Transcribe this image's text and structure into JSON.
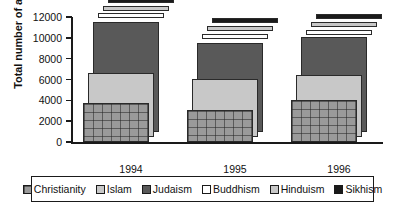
{
  "chart_data": {
    "type": "bar",
    "title": "",
    "xlabel": "Year",
    "ylabel": "Total number of articles",
    "categories": [
      "1994",
      "1995",
      "1996"
    ],
    "ylim": [
      0,
      12000
    ],
    "ytick_labels": [
      "0",
      "2000",
      "4000",
      "6000",
      "8000",
      "10000",
      "12000"
    ],
    "ytick_values": [
      0,
      2000,
      4000,
      6000,
      8000,
      10000,
      12000
    ],
    "grid": false,
    "legend_position": "bottom",
    "series": [
      {
        "name": "Christianity",
        "color": "#9a9a9a",
        "pattern": "checkered",
        "values": [
          3750,
          3100,
          4000
        ]
      },
      {
        "name": "Islam",
        "color": "#c8c8c8",
        "pattern": "solid-light",
        "values": [
          6150,
          5550,
          6000
        ]
      },
      {
        "name": "Judaism",
        "color": "#595959",
        "pattern": "solid-dark",
        "values": [
          10600,
          8550,
          9100
        ]
      },
      {
        "name": "Buddhism",
        "color": "#ffffff",
        "pattern": "solid-white",
        "values": [
          10900,
          8900,
          9350
        ]
      },
      {
        "name": "Hinduism",
        "color": "#c8c8c8",
        "pattern": "solid-light",
        "values": [
          11150,
          9200,
          9600
        ]
      },
      {
        "name": "Sikhism",
        "color": "#1a1a1a",
        "pattern": "solid-black",
        "values": [
          11400,
          9500,
          9850
        ]
      }
    ]
  },
  "axes": {
    "y_title": "Total number of articles",
    "x_title": "Year",
    "y_ticks": [
      {
        "label": "12000",
        "value": 12000
      },
      {
        "label": "10000",
        "value": 10000
      },
      {
        "label": "8000",
        "value": 8000
      },
      {
        "label": "6000",
        "value": 6000
      },
      {
        "label": "4000",
        "value": 4000
      },
      {
        "label": "2000",
        "value": 2000
      },
      {
        "label": "0",
        "value": 0
      }
    ],
    "x_labels": [
      "1994",
      "1995",
      "1996"
    ]
  },
  "legend": {
    "items": [
      {
        "label": "Christianity",
        "color": "#9a9a9a"
      },
      {
        "label": "Islam",
        "color": "#c8c8c8"
      },
      {
        "label": "Judaism",
        "color": "#595959"
      },
      {
        "label": "Buddhism",
        "color": "#ffffff"
      },
      {
        "label": "Hinduism",
        "color": "#c8c8c8"
      },
      {
        "label": "Sikhism",
        "color": "#1a1a1a"
      }
    ]
  }
}
